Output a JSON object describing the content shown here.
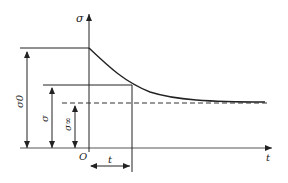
{
  "diagram": {
    "axes": {
      "y_label": "σ",
      "x_label": "t",
      "origin_label": "O"
    },
    "labels": {
      "sigma0": "σ0",
      "sigma": "σ",
      "sigma_inf": "σ∞",
      "time_interval": "t"
    },
    "colors": {
      "line": "#222222",
      "axis": "#555555",
      "background": "#ffffff"
    }
  }
}
